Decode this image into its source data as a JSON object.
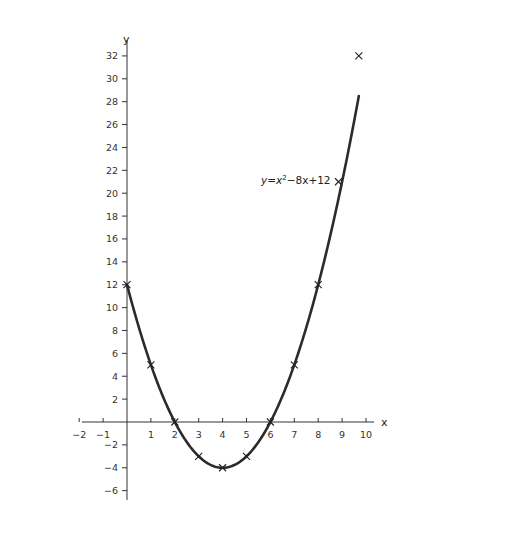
{
  "chart_data": {
    "type": "line",
    "title": "",
    "xlabel": "x",
    "ylabel": "y",
    "xlim": [
      -2,
      10.5
    ],
    "ylim": [
      -7,
      33
    ],
    "grid": false,
    "x_ticks": [
      -2,
      -1,
      1,
      2,
      3,
      4,
      5,
      6,
      7,
      8,
      9,
      10
    ],
    "y_ticks": [
      -6,
      -4,
      -2,
      2,
      4,
      6,
      8,
      10,
      12,
      14,
      16,
      18,
      20,
      22,
      24,
      26,
      28,
      30,
      32
    ],
    "series": [
      {
        "name": "y=x²−8x+12",
        "equation": "y = x^2 - 8x + 12",
        "curve_x_range": [
          0,
          9.7
        ],
        "points": [
          {
            "x": 0,
            "y": 12
          },
          {
            "x": 1,
            "y": 5
          },
          {
            "x": 2,
            "y": 0
          },
          {
            "x": 3,
            "y": -3
          },
          {
            "x": 4,
            "y": -4
          },
          {
            "x": 5,
            "y": -3
          },
          {
            "x": 6,
            "y": 0
          },
          {
            "x": 7,
            "y": 5
          },
          {
            "x": 8,
            "y": 12
          },
          {
            "x": 8.85,
            "y": 21
          },
          {
            "x": 9.7,
            "y": 32
          }
        ]
      }
    ],
    "annotations": [
      {
        "text_prefix": "y=x",
        "superscript": "2",
        "text_suffix": "−8x+12",
        "x": 5.6,
        "y": 21
      }
    ]
  },
  "labels": {
    "x_axis": "x",
    "y_axis": "y",
    "equation_prefix": "y=x",
    "equation_sup": "2",
    "equation_suffix": "−8x+12"
  }
}
